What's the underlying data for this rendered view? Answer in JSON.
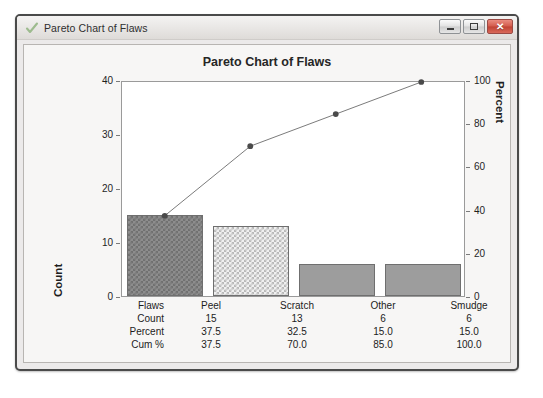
{
  "window": {
    "title": "Pareto Chart of Flaws",
    "icon": "checkmark-icon",
    "buttons": {
      "minimize": "—",
      "maximize": "□",
      "close": "✕"
    }
  },
  "chart_data": {
    "type": "bar",
    "title": "Pareto Chart of Flaws",
    "categories": [
      "Peel",
      "Scratch",
      "Other",
      "Smudge"
    ],
    "values": [
      15,
      13,
      6,
      6
    ],
    "xlabel": "",
    "ylabel": "Count",
    "ylim": [
      0,
      40
    ],
    "y_ticks": [
      0,
      10,
      20,
      30,
      40
    ],
    "secondary": {
      "name": "Cum %",
      "ylabel": "Percent",
      "ylim": [
        0,
        100
      ],
      "y_ticks": [
        0,
        20,
        40,
        60,
        80,
        100
      ],
      "values": [
        37.5,
        70.0,
        85.0,
        100.0
      ]
    },
    "percent": [
      37.5,
      32.5,
      15.0,
      15.0
    ],
    "grid": false,
    "legend": "none",
    "bar_fills": [
      "checker-dark",
      "checker-light",
      "solid",
      "solid"
    ],
    "line_color": "#7a7a7a",
    "marker_color": "#4a4a4a"
  },
  "table": {
    "rows": [
      {
        "label": "Flaws",
        "cells": [
          "Peel",
          "Scratch",
          "Other",
          "Smudge"
        ]
      },
      {
        "label": "Count",
        "cells": [
          "15",
          "13",
          "6",
          "6"
        ]
      },
      {
        "label": "Percent",
        "cells": [
          "37.5",
          "32.5",
          "15.0",
          "15.0"
        ]
      },
      {
        "label": "Cum %",
        "cells": [
          "37.5",
          "70.0",
          "85.0",
          "100.0"
        ]
      }
    ]
  },
  "axes": {
    "left": {
      "label": "Count",
      "ticks": [
        "40",
        "30",
        "20",
        "10",
        "0"
      ]
    },
    "right": {
      "label": "Percent",
      "ticks": [
        "100",
        "80",
        "60",
        "40",
        "20",
        "0"
      ]
    }
  }
}
